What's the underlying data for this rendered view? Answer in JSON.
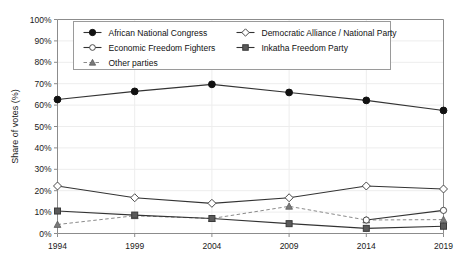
{
  "chart_data": {
    "type": "line",
    "title": "",
    "subtitle": "",
    "xlabel": "",
    "ylabel": "Share of votes (%)",
    "categories": [
      "1994",
      "1999",
      "2004",
      "2009",
      "2014",
      "2019"
    ],
    "x": [
      1994,
      1999,
      2004,
      2009,
      2014,
      2019
    ],
    "ylim": [
      0,
      100
    ],
    "ytick_labels": [
      "0%",
      "10%",
      "20%",
      "30%",
      "40%",
      "50%",
      "60%",
      "70%",
      "80%",
      "90%",
      "100%"
    ],
    "ytick_values": [
      0,
      10,
      20,
      30,
      40,
      50,
      60,
      70,
      80,
      90,
      100
    ],
    "grid": true,
    "legend_position": "top-left-inside",
    "series": [
      {
        "name": "African National Congress",
        "marker": "filled-circle",
        "linestyle": "solid",
        "values": [
          62.6,
          66.4,
          69.7,
          65.9,
          62.2,
          57.5
        ]
      },
      {
        "name": "Democratic Alliance / National Party",
        "marker": "open-diamond",
        "linestyle": "solid",
        "values": [
          22.2,
          16.7,
          14.1,
          16.7,
          22.2,
          20.8
        ]
      },
      {
        "name": "Economic Freedom Fighters",
        "marker": "open-circle",
        "linestyle": "solid",
        "values": [
          null,
          null,
          null,
          null,
          6.3,
          10.8
        ]
      },
      {
        "name": "Inkatha Freedom Party",
        "marker": "filled-square",
        "linestyle": "solid",
        "values": [
          10.5,
          8.6,
          7.0,
          4.6,
          2.4,
          3.4
        ]
      },
      {
        "name": "Other parties",
        "marker": "filled-triangle",
        "linestyle": "dashed",
        "values": [
          4.2,
          8.3,
          7.0,
          12.7,
          6.3,
          6.5
        ]
      }
    ]
  },
  "legend": {
    "entries": [
      "African National Congress",
      "Democratic Alliance / National Party",
      "Economic Freedom Fighters",
      "Inkatha Freedom Party",
      "Other parties"
    ]
  }
}
